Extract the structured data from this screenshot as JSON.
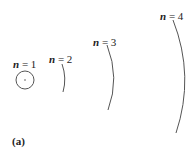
{
  "labels": [
    {
      "var": "n",
      "eq": " = 1"
    },
    {
      "var": "n",
      "eq": " = 2"
    },
    {
      "var": "n",
      "eq": " = 3"
    },
    {
      "var": "n",
      "eq": " = 4"
    }
  ],
  "caption": "(a)"
}
